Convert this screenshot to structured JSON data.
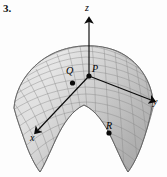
{
  "figure": {
    "number": "3.",
    "type": "3d-surface-plot",
    "background_color": "#fdfdfd",
    "surface": {
      "shade_light": "#e6e6e6",
      "shade_mid": "#c9c9c9",
      "shade_dark": "#a8a8a8",
      "mesh_color": "#8d8d8d",
      "outline_color": "#6f6f6f"
    },
    "axes": {
      "color": "#0a0a0a",
      "items": [
        {
          "name": "z",
          "label": "z",
          "direction": "up"
        },
        {
          "name": "y",
          "label": "y",
          "direction": "right"
        },
        {
          "name": "x",
          "label": "x",
          "direction": "down-left"
        }
      ]
    },
    "points": [
      {
        "name": "P",
        "label": "P",
        "dot_color": "#0a0a0a"
      },
      {
        "name": "Q",
        "label": "Q",
        "dot_color": "#0a0a0a"
      },
      {
        "name": "R",
        "label": "R",
        "dot_color": "#0a0a0a"
      }
    ]
  }
}
